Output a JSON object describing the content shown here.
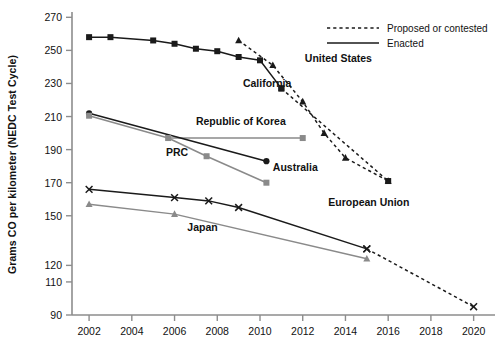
{
  "chart_data": {
    "type": "line",
    "title": "",
    "xlabel": "",
    "ylabel": "Grams CO per kilometer (NEDC Test Cycle)",
    "xlim": [
      2001.2,
      2021
    ],
    "ylim": [
      90,
      272
    ],
    "grid": false,
    "xticks": [
      2002,
      2004,
      2006,
      2008,
      2010,
      2012,
      2014,
      2016,
      2018,
      2020
    ],
    "yticks": [
      90,
      110,
      120,
      150,
      170,
      190,
      210,
      230,
      250,
      270
    ],
    "legend": {
      "position": "top-right",
      "entries": [
        {
          "label": "Proposed or contested",
          "style": "dashed"
        },
        {
          "label": "Enacted",
          "style": "solid"
        }
      ]
    },
    "series": [
      {
        "name": "United States",
        "marker": "square",
        "color": "#1a1a1a",
        "enacted": [
          {
            "x": 2002,
            "y": 258
          },
          {
            "x": 2003,
            "y": 258
          },
          {
            "x": 2005,
            "y": 256
          },
          {
            "x": 2006,
            "y": 254
          },
          {
            "x": 2007,
            "y": 251
          },
          {
            "x": 2008,
            "y": 249.5
          },
          {
            "x": 2009,
            "y": 246
          },
          {
            "x": 2010,
            "y": 244
          },
          {
            "x": 2011,
            "y": 227
          }
        ],
        "proposed": [
          {
            "x": 2011,
            "y": 227
          },
          {
            "x": 2016,
            "y": 171
          }
        ],
        "label_x": 2012.1,
        "label_y": 243
      },
      {
        "name": "California",
        "marker": "triangle",
        "color": "#1a1a1a",
        "enacted": [],
        "proposed": [
          {
            "x": 2009,
            "y": 256
          },
          {
            "x": 2010.6,
            "y": 241
          },
          {
            "x": 2012,
            "y": 219
          },
          {
            "x": 2013,
            "y": 200
          },
          {
            "x": 2014,
            "y": 185
          },
          {
            "x": 2016,
            "y": 171
          }
        ],
        "label_x": 2009.2,
        "label_y": 228
      },
      {
        "name": "Republic of Korea",
        "marker": "square-gray",
        "color": "#8a8a8a",
        "enacted": [],
        "proposed": [],
        "leader_from_x": 2005.7,
        "leader_to_x": 2012,
        "leader_y": 197,
        "point_x": 2012,
        "point_y": 197,
        "label_x": 2007.0,
        "label_y": 205
      },
      {
        "name": "Australia",
        "marker": "circle",
        "color": "#1a1a1a",
        "enacted": [
          {
            "x": 2002,
            "y": 212
          },
          {
            "x": 2010.3,
            "y": 183
          }
        ],
        "proposed": [],
        "label_x": 2010.6,
        "label_y": 177
      },
      {
        "name": "PRC",
        "marker": "square-gray",
        "color": "#8a8a8a",
        "enacted": [
          {
            "x": 2002,
            "y": 210.5
          },
          {
            "x": 2005.7,
            "y": 197
          },
          {
            "x": 2007.5,
            "y": 186
          },
          {
            "x": 2010.3,
            "y": 170
          }
        ],
        "proposed": [],
        "label_x": 2005.6,
        "label_y": 186
      },
      {
        "name": "European Union",
        "marker": "x",
        "color": "#1a1a1a",
        "enacted": [
          {
            "x": 2002,
            "y": 166
          },
          {
            "x": 2006,
            "y": 161
          },
          {
            "x": 2007.6,
            "y": 159
          },
          {
            "x": 2009,
            "y": 155
          },
          {
            "x": 2015,
            "y": 130
          }
        ],
        "proposed": [
          {
            "x": 2015,
            "y": 130
          },
          {
            "x": 2020,
            "y": 95
          }
        ],
        "label_x": 2013.2,
        "label_y": 156
      },
      {
        "name": "Japan",
        "marker": "triangle-gray",
        "color": "#8a8a8a",
        "enacted": [
          {
            "x": 2002,
            "y": 157
          },
          {
            "x": 2006,
            "y": 151
          },
          {
            "x": 2015,
            "y": 124
          }
        ],
        "proposed": [],
        "label_x": 2006.6,
        "label_y": 141
      }
    ]
  }
}
